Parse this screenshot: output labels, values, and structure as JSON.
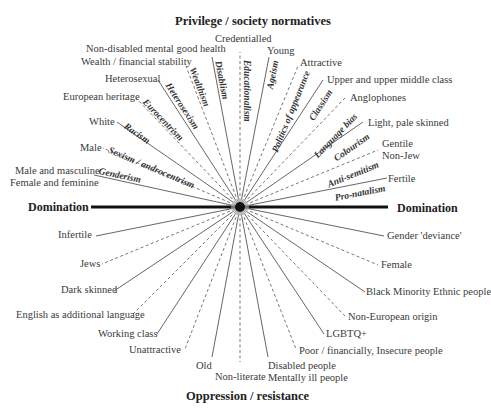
{
  "title_top": "Privilege / society normatives",
  "title_bottom": "Oppression / resistance",
  "axis": {
    "left": "Domination",
    "right": "Domination"
  },
  "privileged": [
    {
      "id": "credentialled",
      "label": "Credentialled"
    },
    {
      "id": "young",
      "label": "Young"
    },
    {
      "id": "nondisabled",
      "label": "Non-disabled mental good health"
    },
    {
      "id": "wealth",
      "label": "Wealth / financial stability"
    },
    {
      "id": "attractive",
      "label": "Attractive"
    },
    {
      "id": "heterosexual",
      "label": "Heterosexual"
    },
    {
      "id": "upperclass",
      "label": "Upper and upper middle class"
    },
    {
      "id": "anglophones",
      "label": "Anglophones"
    },
    {
      "id": "european",
      "label": "European heritage"
    },
    {
      "id": "white",
      "label": "White"
    },
    {
      "id": "lightskin",
      "label": "Light, pale skinned"
    },
    {
      "id": "male",
      "label": "Male"
    },
    {
      "id": "gentile1",
      "label": "Gentile"
    },
    {
      "id": "gentile2",
      "label": "Non-Jew"
    },
    {
      "id": "gender1",
      "label": "Male and masculine"
    },
    {
      "id": "gender2",
      "label": "Female and feminine"
    },
    {
      "id": "fertile",
      "label": "Fertile"
    }
  ],
  "isms": [
    {
      "id": "disablism",
      "label": "Disablism"
    },
    {
      "id": "educationalism",
      "label": "Educationalism"
    },
    {
      "id": "ageism",
      "label": "Ageism"
    },
    {
      "id": "wealthism",
      "label": "Wealthism"
    },
    {
      "id": "appearance",
      "label": "Politics of appearance"
    },
    {
      "id": "heterosexism",
      "label": "Heterosexism"
    },
    {
      "id": "classism",
      "label": "Classism"
    },
    {
      "id": "eurocentrism",
      "label": "Eurocentrism"
    },
    {
      "id": "languagebias",
      "label": "Language bias"
    },
    {
      "id": "racism",
      "label": "Racism"
    },
    {
      "id": "colourism",
      "label": "Colourism"
    },
    {
      "id": "sexism",
      "label": "Sexism / androcentrism"
    },
    {
      "id": "antisemitism",
      "label": "Anti-semitism"
    },
    {
      "id": "genderism",
      "label": "Genderism"
    },
    {
      "id": "pronatalism",
      "label": "Pro-natalism"
    }
  ],
  "oppressed": [
    {
      "id": "infertile",
      "label": "Infertile"
    },
    {
      "id": "genderdeviance",
      "label": "Gender 'deviance'"
    },
    {
      "id": "jews",
      "label": "Jews"
    },
    {
      "id": "female",
      "label": "Female"
    },
    {
      "id": "darkskinned",
      "label": "Dark skinned"
    },
    {
      "id": "bme",
      "label": "Black Minority Ethnic people"
    },
    {
      "id": "eal",
      "label": "English as additional language"
    },
    {
      "id": "noneuropean",
      "label": "Non-European origin"
    },
    {
      "id": "workingclass",
      "label": "Working class"
    },
    {
      "id": "lgbtq",
      "label": "LGBTQ+"
    },
    {
      "id": "unattractive",
      "label": "Unattractive"
    },
    {
      "id": "poor",
      "label": "Poor / financially, Insecure people"
    },
    {
      "id": "old",
      "label": "Old"
    },
    {
      "id": "nonliterate",
      "label": "Non-literate"
    },
    {
      "id": "disabled1",
      "label": "Disabled people"
    },
    {
      "id": "disabled2",
      "label": "Mentally ill people"
    }
  ]
}
